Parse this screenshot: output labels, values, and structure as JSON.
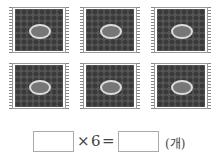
{
  "figure": {
    "packets": [
      {
        "row": 1,
        "col": 1
      },
      {
        "row": 1,
        "col": 2
      },
      {
        "row": 1,
        "col": 3
      },
      {
        "row": 2,
        "col": 1
      },
      {
        "row": 2,
        "col": 2
      },
      {
        "row": 2,
        "col": 3
      }
    ],
    "packet_count": 6,
    "packet_icon": "bean-packet-icon"
  },
  "equation": {
    "first_blank": "",
    "operator": "×",
    "multiplier": "6",
    "equals": "=",
    "result_blank": "",
    "unit": "(개)"
  }
}
